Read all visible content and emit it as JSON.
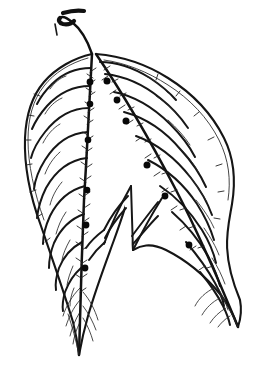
{
  "figure": {
    "style": "ink line drawing",
    "caption": "",
    "background_color": "#ffffff",
    "ink_color": "#151515",
    "dot_color": "#080808",
    "canvas": {
      "width": 256,
      "height": 369
    }
  },
  "parts": {
    "petiole_label": "petiole",
    "apex_label": "leaf apex",
    "left_lobe_label": "left lobe",
    "right_lobe_label": "right lobe",
    "sinus_label": "sinus",
    "midrib_label": "midrib",
    "lateral_vein_label": "lateral vein",
    "margin_label": "leaf margin",
    "gland_label": "gland dot",
    "hair_label": "marginal hair"
  },
  "geometry": {
    "petiole": {
      "stalk_path": "M 92 54 C 88 42 82 30 72 22 C 66 17 62 16 60 18",
      "hook_path": "M 60 18 C 58 20 59 23 63 24 C 68 25 72 23 74 21",
      "top_flick_path": "M 63 13 C 70 11 78 10 84 11",
      "side_tick_path": "M 55 24 L 57 35"
    },
    "left_lobe": {
      "outline_path": "M 92 54 C 74 58 56 68 44 82 C 32 96 26 114 25 138 C 24 166 30 196 41 226 C 52 258 64 292 73 322 C 76 334 78 346 79 355 C 81 344 84 330 88 316 C 96 288 106 262 114 240 C 122 218 128 200 131 186 L 133 250",
      "margin_inner_path": "M 88 58 C 70 63 54 73 44 86 C 33 100 28 118 28 140 C 28 164 34 192 44 220",
      "midrib_path": "M 92 54 C 90 96 87 150 84 200 C 82 250 80 310 79 355",
      "tip_path": "M 79 355 C 76 340 72 326 68 314"
    },
    "right_lobe": {
      "outline_path": "M 96 54 C 120 56 146 64 168 78 C 192 93 212 114 224 138 C 234 158 236 180 232 204 C 228 228 220 252 240 300 C 242 310 241 318 238 327 C 234 316 228 304 220 294 C 202 272 182 258 166 250 C 150 242 140 246 133 250",
      "margin_inner_path": "M 104 60 C 126 63 148 72 168 85 C 190 99 208 118 219 140 C 229 160 231 180 228 200",
      "midrib_path": "M 96 54 C 122 92 150 140 176 190 C 200 236 222 288 238 327",
      "tip_path": "M 238 327 C 232 314 226 302 218 292"
    },
    "sinus": {
      "notch_path": "M 131 186 L 133 250",
      "left_branch_path": "M 131 186 C 122 202 112 222 104 244",
      "right_branch_path": "M 133 250 C 142 232 152 214 162 198"
    },
    "left_veins": [
      {
        "d": "M 91 68 C 76 68 62 74 52 84 C 44 92 40 98 37 104"
      },
      {
        "d": "M 90 86 C 73 86 58 94 47 106 C 39 115 35 122 32 129"
      },
      {
        "d": "M 89 108 C 71 108 56 118 45 132 C 37 142 33 150 31 158"
      },
      {
        "d": "M 88 132 C 70 133 55 144 45 160 C 38 171 35 180 34 189"
      },
      {
        "d": "M 87 158 C 69 160 55 172 46 188 C 40 200 38 209 37 218"
      },
      {
        "d": "M 85 186 C 69 190 57 202 50 216 C 45 227 43 236 43 244"
      },
      {
        "d": "M 84 214 C 70 219 60 230 54 243 C 50 253 49 261 49 268"
      },
      {
        "d": "M 82 242 C 71 248 63 258 59 268 C 56 277 55 284 56 290"
      },
      {
        "d": "M 81 268 C 73 275 68 284 65 292 C 63 299 62 305 63 311"
      }
    ],
    "left_veins_secondary": [
      {
        "d": "M 66 76 C 60 78 54 83 50 89"
      },
      {
        "d": "M 62 98 C 55 101 49 107 45 114"
      },
      {
        "d": "M 60 124 C 53 128 47 135 43 143"
      },
      {
        "d": "M 60 152 C 53 158 48 166 45 174"
      },
      {
        "d": "M 62 182 C 56 189 52 197 50 205"
      },
      {
        "d": "M 66 212 C 61 219 58 227 56 234"
      },
      {
        "d": "M 70 240 C 66 247 63 254 62 260"
      },
      {
        "d": "M 73 266 C 70 273 68 279 67 285"
      },
      {
        "d": "M 74 288 C 71 295 70 301 70 306"
      }
    ],
    "right_veins": [
      {
        "d": "M 100 62 C 116 62 134 68 150 78 C 162 86 170 93 176 100"
      },
      {
        "d": "M 105 74 C 124 76 144 85 160 98 C 174 109 182 119 188 128"
      },
      {
        "d": "M 114 92 C 134 96 154 108 170 124 C 182 136 190 147 195 157"
      },
      {
        "d": "M 124 112 C 146 118 166 132 181 150 C 194 164 201 176 206 187"
      },
      {
        "d": "M 136 136 C 158 144 177 160 191 178 C 202 192 208 204 212 215"
      },
      {
        "d": "M 148 160 C 168 170 185 186 197 204 C 206 218 211 230 214 240"
      },
      {
        "d": "M 160 186 C 178 198 192 214 202 230 C 210 243 214 254 216 263"
      },
      {
        "d": "M 172 212 C 188 226 200 242 208 256 C 214 268 218 278 220 286"
      },
      {
        "d": "M 186 242 C 198 256 208 270 215 283 C 220 292 223 300 224 306"
      },
      {
        "d": "M 200 272 C 210 284 218 296 223 306 C 227 314 229 320 230 325"
      }
    ],
    "right_veins_secondary": [
      {
        "d": "M 146 76 C 154 80 162 86 168 93"
      },
      {
        "d": "M 156 96 C 165 102 173 109 179 117"
      },
      {
        "d": "M 168 120 C 177 128 184 136 190 145"
      },
      {
        "d": "M 178 146 C 187 155 194 164 199 173"
      },
      {
        "d": "M 188 174 C 196 184 202 193 207 202"
      },
      {
        "d": "M 196 200 C 204 210 210 219 214 228"
      },
      {
        "d": "M 204 228 C 211 238 216 247 219 255"
      },
      {
        "d": "M 212 258 C 218 267 222 276 225 284"
      },
      {
        "d": "M 218 288 C 223 296 226 303 228 310"
      }
    ],
    "left_tip_veins": [
      {
        "d": "M 80 288 C 72 296 66 306 63 316"
      },
      {
        "d": "M 80 300 C 73 308 69 317 66 326"
      },
      {
        "d": "M 80 312 C 75 320 72 328 70 336"
      },
      {
        "d": "M 80 322 C 76 330 74 337 73 344"
      },
      {
        "d": "M 83 292 C 90 300 95 310 98 320"
      },
      {
        "d": "M 83 306 C 89 314 93 322 96 330"
      },
      {
        "d": "M 83 318 C 88 326 91 334 93 341"
      }
    ],
    "right_tip_veins": [
      {
        "d": "M 214 288 C 206 292 199 298 195 306"
      },
      {
        "d": "M 220 298 C 212 302 206 308 202 315"
      },
      {
        "d": "M 226 308 C 219 312 214 317 210 323"
      },
      {
        "d": "M 230 316 C 225 319 221 323 218 327"
      }
    ],
    "sinus_veins": [
      {
        "d": "M 128 196 C 118 206 110 218 104 230"
      },
      {
        "d": "M 126 208 C 117 218 110 228 105 238"
      },
      {
        "d": "M 132 236 C 141 224 150 212 158 202"
      },
      {
        "d": "M 133 244 C 142 234 150 224 158 216"
      },
      {
        "d": "M 104 230 C 96 236 90 242 86 248"
      },
      {
        "d": "M 105 242 C 98 248 93 254 89 260"
      }
    ],
    "hairs_left_midrib": [
      {
        "d": "M 90 72 L 96 68"
      },
      {
        "d": "M 89 84 L 95 80"
      },
      {
        "d": "M 89 96 L 95 92"
      },
      {
        "d": "M 88 112 L 94 108"
      },
      {
        "d": "M 87 124 L 93 120"
      },
      {
        "d": "M 87 140 L 93 136"
      },
      {
        "d": "M 86 152 L 92 148"
      },
      {
        "d": "M 86 168 L 92 164"
      },
      {
        "d": "M 85 180 L 91 176"
      },
      {
        "d": "M 84 196 L 90 192"
      },
      {
        "d": "M 84 208 L 90 204"
      },
      {
        "d": "M 83 222 L 89 218"
      },
      {
        "d": "M 82 236 L 88 232"
      },
      {
        "d": "M 82 250 L 88 246"
      },
      {
        "d": "M 81 264 L 87 260"
      },
      {
        "d": "M 81 278 L 87 274"
      },
      {
        "d": "M 80 292 L 86 288"
      },
      {
        "d": "M 93 78 L 87 74"
      },
      {
        "d": "M 92 92 L 86 88"
      },
      {
        "d": "M 91 106 L 85 102"
      },
      {
        "d": "M 90 120 L 84 116"
      },
      {
        "d": "M 89 136 L 83 132"
      },
      {
        "d": "M 88 150 L 82 146"
      },
      {
        "d": "M 87 166 L 81 162"
      },
      {
        "d": "M 86 182 L 80 178"
      },
      {
        "d": "M 85 198 L 79 194"
      },
      {
        "d": "M 84 214 L 78 210"
      },
      {
        "d": "M 83 230 L 77 226"
      },
      {
        "d": "M 82 246 L 76 242"
      },
      {
        "d": "M 82 262 L 76 258"
      },
      {
        "d": "M 81 278 L 75 274"
      }
    ],
    "hairs_right_midrib": [
      {
        "d": "M 104 70 L 110 66"
      },
      {
        "d": "M 112 82 L 118 79"
      },
      {
        "d": "M 120 96 L 126 93"
      },
      {
        "d": "M 128 110 L 134 107"
      },
      {
        "d": "M 137 126 L 143 123"
      },
      {
        "d": "M 145 142 L 151 139"
      },
      {
        "d": "M 154 158 L 160 155"
      },
      {
        "d": "M 162 174 L 168 172"
      },
      {
        "d": "M 171 192 L 177 190"
      },
      {
        "d": "M 180 210 L 186 208"
      },
      {
        "d": "M 189 228 L 195 226"
      },
      {
        "d": "M 198 248 L 204 246"
      },
      {
        "d": "M 207 268 L 213 266"
      },
      {
        "d": "M 108 76 L 102 80"
      },
      {
        "d": "M 116 90 L 110 94"
      },
      {
        "d": "M 125 105 L 119 109"
      },
      {
        "d": "M 133 120 L 127 124"
      },
      {
        "d": "M 142 137 L 136 141"
      },
      {
        "d": "M 151 154 L 145 158"
      },
      {
        "d": "M 160 172 L 154 176"
      },
      {
        "d": "M 168 188 L 162 192"
      },
      {
        "d": "M 177 206 L 171 210"
      },
      {
        "d": "M 186 226 L 180 230"
      },
      {
        "d": "M 196 246 L 190 250"
      },
      {
        "d": "M 205 266 L 199 270"
      }
    ],
    "hairs_margin": [
      {
        "d": "M 40 96 L 34 94"
      },
      {
        "d": "M 34 116 L 28 115"
      },
      {
        "d": "M 31 140 L 25 140"
      },
      {
        "d": "M 32 164 L 26 165"
      },
      {
        "d": "M 36 190 L 30 192"
      },
      {
        "d": "M 42 214 L 37 217"
      },
      {
        "d": "M 50 238 L 45 242"
      },
      {
        "d": "M 156 80 L 158 74"
      },
      {
        "d": "M 176 96 L 180 91"
      },
      {
        "d": "M 194 116 L 199 112"
      },
      {
        "d": "M 208 140 L 214 137"
      },
      {
        "d": "M 216 166 L 222 164"
      },
      {
        "d": "M 218 192 L 224 191"
      },
      {
        "d": "M 214 218 L 220 219"
      }
    ],
    "gland_dots": [
      {
        "cx": 90,
        "cy": 82,
        "r": 3.4
      },
      {
        "cx": 107,
        "cy": 81,
        "r": 3.5
      },
      {
        "cx": 90,
        "cy": 104,
        "r": 3.3
      },
      {
        "cx": 117,
        "cy": 100,
        "r": 3.4
      },
      {
        "cx": 126,
        "cy": 121,
        "r": 3.5
      },
      {
        "cx": 88,
        "cy": 140,
        "r": 3.3
      },
      {
        "cx": 147,
        "cy": 165,
        "r": 3.5
      },
      {
        "cx": 87,
        "cy": 190,
        "r": 3.3
      },
      {
        "cx": 165,
        "cy": 196,
        "r": 3.4
      },
      {
        "cx": 86,
        "cy": 225,
        "r": 3.4
      },
      {
        "cx": 189,
        "cy": 245,
        "r": 3.4
      },
      {
        "cx": 85,
        "cy": 268,
        "r": 3.4
      }
    ]
  }
}
